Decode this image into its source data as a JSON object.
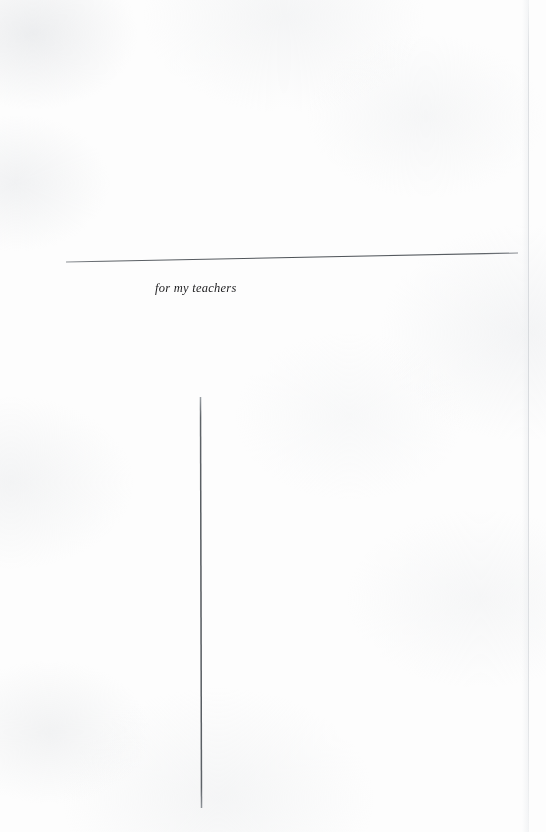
{
  "page": {
    "kind": "book-dedication-page",
    "width": 546,
    "height": 832,
    "background_color": "#fdfdfd",
    "ink_color": "#1d1d1f",
    "rule_color": "#555555"
  },
  "dedication": {
    "text": "for my teachers"
  },
  "rules": {
    "horizontal": {
      "name": "horizontal-rule",
      "x1": 66,
      "y1": 262,
      "x2": 518,
      "y2": 253,
      "thickness": 1.1,
      "color": "#555a5f"
    },
    "vertical": {
      "name": "vertical-rule",
      "x1": 200,
      "y1": 397,
      "x2": 201,
      "y2": 808,
      "thickness": 1.5,
      "color": "#585d62"
    }
  },
  "scan_edge": {
    "name": "right-scan-edge",
    "x": 528,
    "color": "#cdd0d4"
  }
}
